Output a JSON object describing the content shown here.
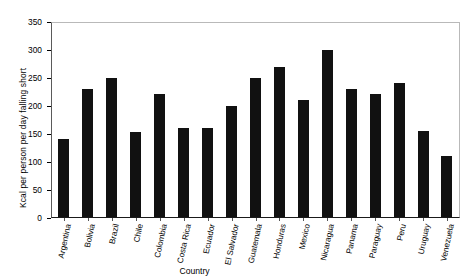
{
  "chart_data": {
    "type": "bar",
    "title": "",
    "xlabel": "Country",
    "ylabel": "Kcal per person per day falling short",
    "categories": [
      "Argentina",
      "Bolivia",
      "Brazil",
      "Chile",
      "Colombia",
      "Costa Rica",
      "Ecuador",
      "El Salvador",
      "Guatemala",
      "Honduras",
      "Mexico",
      "Nicaragua",
      "Panama",
      "Paraguay",
      "Peru",
      "Uruguay",
      "Venezuela"
    ],
    "values": [
      140,
      230,
      250,
      152,
      220,
      160,
      160,
      200,
      250,
      270,
      210,
      300,
      230,
      220,
      240,
      155,
      110
    ],
    "ylim": [
      0,
      350
    ],
    "yticks": [
      0,
      50,
      100,
      150,
      200,
      250,
      300,
      350
    ],
    "ytick_labels": [
      "0",
      "50",
      "100",
      "150",
      "200",
      "250",
      "300",
      "350"
    ],
    "grid": false,
    "legend": false,
    "bar_color": "#111111",
    "frame_color": "#b9b9b9",
    "axis_color": "#1a1a1a",
    "background": "#ffffff"
  }
}
